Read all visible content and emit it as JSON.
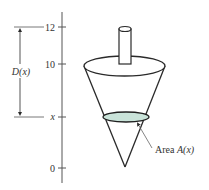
{
  "diagram": {
    "type": "conical tank cross-section with depth axis",
    "axis": {
      "ticks": [
        {
          "label": "12",
          "y": 27
        },
        {
          "label": "10",
          "y": 64
        },
        {
          "label": "x",
          "y": 117
        },
        {
          "label": "0",
          "y": 168
        }
      ]
    },
    "depth_label": "D(x)",
    "area_label_prefix": "Area ",
    "area_label_func": "A(x)",
    "colors": {
      "line": "#2a2a2a",
      "axis": "#555555",
      "cross_section_fill": "#c9e3d9",
      "cross_section_stroke": "#1f1f1f"
    }
  }
}
